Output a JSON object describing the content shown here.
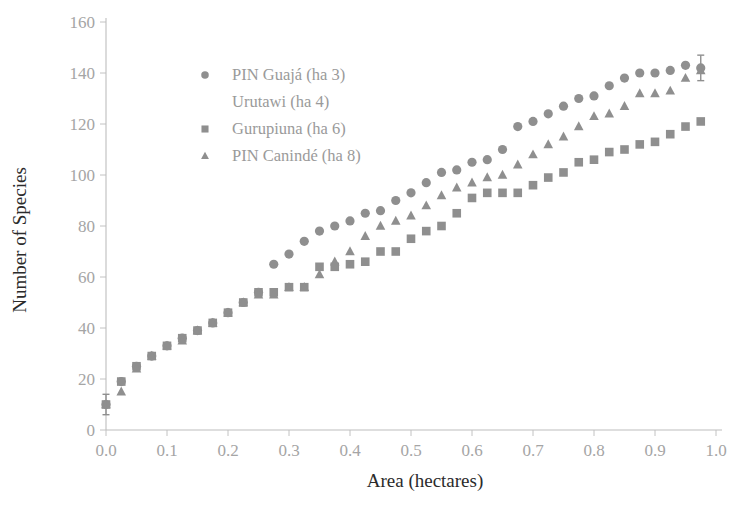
{
  "chart_data": {
    "type": "scatter",
    "title": "",
    "xlabel": "Area (hectares)",
    "ylabel": "Number of Species",
    "xlim": [
      0.0,
      1.0
    ],
    "ylim": [
      0,
      160
    ],
    "xticks": [
      "0.0",
      "0.1",
      "0.2",
      "0.3",
      "0.4",
      "0.5",
      "0.6",
      "0.7",
      "0.8",
      "0.9",
      "1.0"
    ],
    "yticks": [
      "0",
      "20",
      "40",
      "60",
      "80",
      "100",
      "120",
      "140",
      "160"
    ],
    "grid": false,
    "legend_position": "upper-left-inset",
    "marker_color": "#8f8f8f",
    "axis_color": "#bdbdbd",
    "legend": [
      {
        "label": "PIN Guajá (ha 3)",
        "marker": "circle"
      },
      {
        "label": "Urutawi (ha 4)",
        "marker": "none"
      },
      {
        "label": "Gurupiuna (ha 6)",
        "marker": "square"
      },
      {
        "label": "PIN Canindé (ha 8)",
        "marker": "triangle"
      }
    ],
    "series": [
      {
        "name": "PIN Guajá (ha 3)",
        "marker": "circle",
        "x": [
          0.0,
          0.025,
          0.05,
          0.075,
          0.1,
          0.125,
          0.15,
          0.175,
          0.2,
          0.225,
          0.25,
          0.275,
          0.3,
          0.325,
          0.35,
          0.375,
          0.4,
          0.425,
          0.45,
          0.475,
          0.5,
          0.525,
          0.55,
          0.575,
          0.6,
          0.625,
          0.65,
          0.675,
          0.7,
          0.725,
          0.75,
          0.775,
          0.8,
          0.825,
          0.85,
          0.875,
          0.9,
          0.925,
          0.95,
          0.975
        ],
        "y": [
          10,
          19,
          25,
          29,
          33,
          36,
          39,
          42,
          46,
          50,
          54,
          65,
          69,
          74,
          78,
          80,
          82,
          85,
          86,
          90,
          93,
          97,
          101,
          102,
          105,
          106,
          110,
          119,
          121,
          124,
          127,
          130,
          131,
          135,
          138,
          140,
          140,
          141,
          143,
          142
        ]
      },
      {
        "name": "Gurupiuna (ha 6)",
        "marker": "square",
        "x": [
          0.0,
          0.025,
          0.05,
          0.075,
          0.1,
          0.125,
          0.15,
          0.175,
          0.2,
          0.225,
          0.25,
          0.275,
          0.3,
          0.325,
          0.35,
          0.375,
          0.4,
          0.425,
          0.45,
          0.475,
          0.5,
          0.525,
          0.55,
          0.575,
          0.6,
          0.625,
          0.65,
          0.675,
          0.7,
          0.725,
          0.75,
          0.775,
          0.8,
          0.825,
          0.85,
          0.875,
          0.9,
          0.925,
          0.95,
          0.975
        ],
        "y": [
          10,
          19,
          25,
          29,
          33,
          36,
          39,
          42,
          46,
          50,
          54,
          54,
          56,
          56,
          64,
          64,
          65,
          66,
          70,
          70,
          75,
          78,
          80,
          85,
          91,
          93,
          93,
          93,
          96,
          99,
          101,
          105,
          106,
          109,
          110,
          112,
          113,
          116,
          119,
          121
        ]
      },
      {
        "name": "PIN Canindé (ha 8)",
        "marker": "triangle",
        "x": [
          0.0,
          0.025,
          0.05,
          0.075,
          0.1,
          0.125,
          0.15,
          0.175,
          0.2,
          0.225,
          0.25,
          0.275,
          0.3,
          0.325,
          0.35,
          0.375,
          0.4,
          0.425,
          0.45,
          0.475,
          0.5,
          0.525,
          0.55,
          0.575,
          0.6,
          0.625,
          0.65,
          0.675,
          0.7,
          0.725,
          0.75,
          0.775,
          0.8,
          0.825,
          0.85,
          0.875,
          0.9,
          0.925,
          0.95,
          0.975
        ],
        "y": [
          10,
          15,
          24,
          29,
          33,
          35,
          39,
          42,
          46,
          50,
          53,
          53,
          56,
          56,
          61,
          66,
          70,
          76,
          80,
          82,
          84,
          88,
          92,
          95,
          97,
          99,
          100,
          104,
          108,
          112,
          115,
          119,
          123,
          124,
          127,
          132,
          132,
          133,
          138,
          141
        ]
      }
    ],
    "error_bars": [
      {
        "x": 0.0,
        "y": 10,
        "low": 6,
        "high": 14,
        "series": "PIN Guajá (ha 3)"
      },
      {
        "x": 0.975,
        "y": 142,
        "low": 137,
        "high": 147,
        "series": "PIN Guajá (ha 3)"
      }
    ]
  }
}
